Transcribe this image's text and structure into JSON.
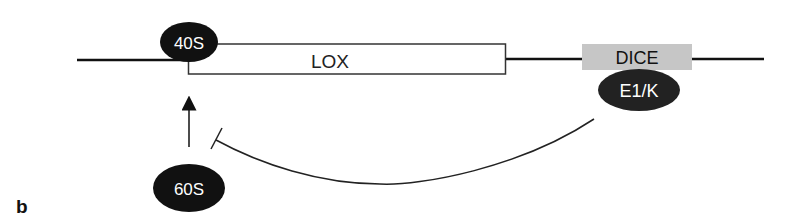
{
  "panel_label": "b",
  "elements": {
    "ribosome_40s": {
      "label": "40S",
      "fill": "#111111",
      "text_color": "#ffffff"
    },
    "lox_box": {
      "label": "LOX",
      "fill": "#ffffff",
      "stroke": "#333333"
    },
    "dice_box": {
      "label": "DICE",
      "fill": "#c6c6c6"
    },
    "e1k_protein": {
      "label": "E1/K",
      "fill": "#222222",
      "text_color": "#ffffff"
    },
    "ribosome_60s": {
      "label": "60S",
      "fill": "#111111",
      "text_color": "#ffffff"
    }
  },
  "relations": [
    {
      "from": "60S",
      "to": "40S",
      "type": "activation-arrow"
    },
    {
      "from": "E1/K",
      "to": "60S-joining",
      "type": "inhibition"
    }
  ]
}
